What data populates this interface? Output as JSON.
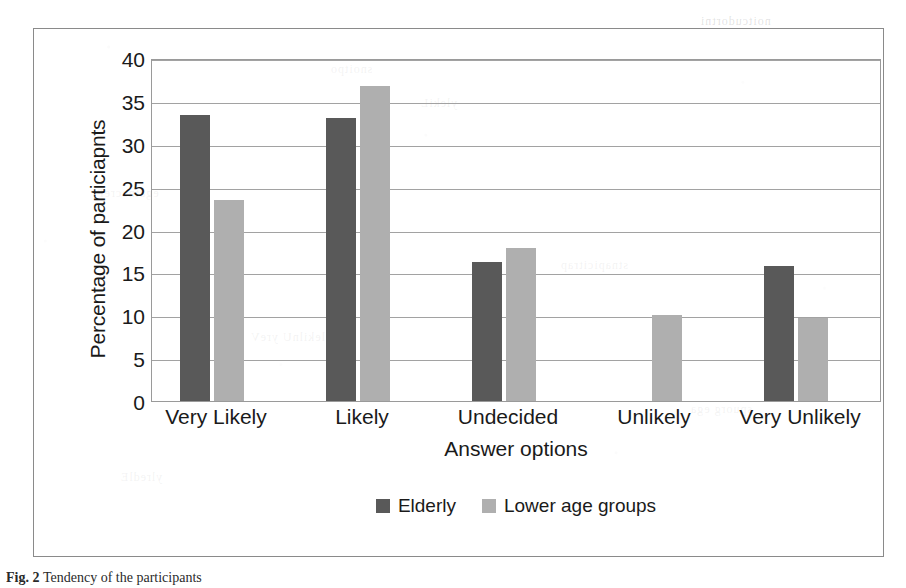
{
  "chart_data": {
    "type": "bar",
    "title": "",
    "xlabel": "Answer options",
    "ylabel": "Percentage of particiapnts",
    "categories": [
      "Very Likely",
      "Likely",
      "Undecided",
      "Unlikely",
      "Very Unlikely"
    ],
    "series": [
      {
        "name": "Elderly",
        "color": "#595959",
        "values": [
          33.3,
          33.0,
          16.2,
          0,
          15.8
        ]
      },
      {
        "name": "Lower age groups",
        "color": "#afafaf",
        "values": [
          23.5,
          36.7,
          17.8,
          10.0,
          9.7
        ]
      }
    ],
    "ylim": [
      0,
      40
    ],
    "yticks": [
      0,
      5,
      10,
      15,
      20,
      25,
      30,
      35,
      40
    ],
    "ytick_labels": [
      "0",
      "5",
      "10",
      "15",
      "20",
      "25",
      "30",
      "35",
      "40"
    ],
    "grid": true,
    "legend_position": "bottom"
  },
  "figure": {
    "caption_label": "Fig. 2",
    "caption_text": "Tendency of the participants"
  },
  "bleed_through": [
    {
      "text": "noitcudortni",
      "x": 700,
      "y": 14
    },
    {
      "text": "snoitpo",
      "x": 330,
      "y": 62
    },
    {
      "text": "ylekiL",
      "x": 420,
      "y": 96
    },
    {
      "text": "egatnecreP",
      "x": 96,
      "y": 186
    },
    {
      "text": "stnapicitrap",
      "x": 560,
      "y": 258
    },
    {
      "text": "ylekilnU yreV",
      "x": 250,
      "y": 330
    },
    {
      "text": "spuorg ega",
      "x": 690,
      "y": 402
    },
    {
      "text": "ylredlE",
      "x": 120,
      "y": 470
    }
  ]
}
